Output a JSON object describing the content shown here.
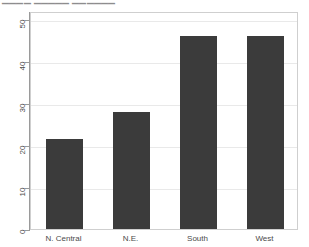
{
  "top_sliver": {
    "text": "▁▁▁▁  ▁▁▁▁▁  ▁▁▁▁▁▁"
  },
  "chart_data": {
    "type": "bar",
    "title": "",
    "subtitle": "",
    "xlabel": "",
    "ylabel": "",
    "categories": [
      "N. Central",
      "N.E.",
      "South",
      "West"
    ],
    "values": [
      21.5,
      28,
      46,
      46
    ],
    "series": [
      {
        "name": "",
        "values": [
          21.5,
          28,
          46,
          46
        ]
      }
    ],
    "ylim": [
      0,
      52
    ],
    "yticks": [
      0,
      10,
      20,
      30,
      40,
      50
    ],
    "ytick_labels": [
      "0",
      "10",
      "20",
      "30",
      "40",
      "50"
    ],
    "xtick_labels": [
      "N. Central",
      "N.E.",
      "South",
      "West"
    ],
    "grid": true,
    "grid_axis": "y",
    "legend": false,
    "legend_position": "none",
    "bar_color": "#3b3b3b",
    "panel_background": "#ffffff",
    "grid_color": "#e9e9e9",
    "axis_color": "#9a9a9a",
    "annotations": []
  }
}
